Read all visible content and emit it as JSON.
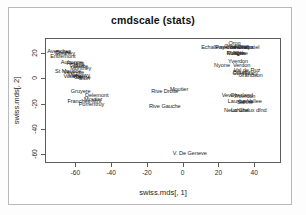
{
  "figure": {
    "title": "cmdscale (stats)",
    "xlabel": "swiss.mds[, 1]",
    "ylabel": "swiss.mds[, 2]",
    "frame_color": "#5c5c5c",
    "text_color": "#1c1c1c",
    "background": "#ffffff"
  },
  "chart_data": {
    "type": "scatter",
    "title": "cmdscale (stats)",
    "xlabel": "swiss.mds[, 1]",
    "ylabel": "swiss.mds[, 2]",
    "xlim": [
      -77,
      55
    ],
    "ylim": [
      -67,
      32
    ],
    "grid": false,
    "legend": null,
    "xticks": [
      -60,
      -40,
      -20,
      0,
      20,
      40
    ],
    "yticks": [
      20,
      0,
      -20,
      -40,
      -60
    ],
    "note": "Each observation is drawn as its text label at its (x,y) coordinate; no plotting symbols are used.",
    "points": [
      {
        "label": "Avenches",
        "x": -69,
        "y": 22
      },
      {
        "label": "Broye",
        "x": -67,
        "y": 21
      },
      {
        "label": "Entremont",
        "x": -67,
        "y": 18
      },
      {
        "label": "Conthey",
        "x": -66,
        "y": 20
      },
      {
        "label": "Aubonne",
        "x": -62,
        "y": 13
      },
      {
        "label": "Herens",
        "x": -60,
        "y": 12
      },
      {
        "label": "Sierre",
        "x": -57,
        "y": 10
      },
      {
        "label": "Glane",
        "x": -59,
        "y": 11
      },
      {
        "label": "St Maurice",
        "x": -64,
        "y": 6
      },
      {
        "label": "Veveyse",
        "x": -61,
        "y": 5
      },
      {
        "label": "Monthey",
        "x": -57,
        "y": 8
      },
      {
        "label": "Martigwy",
        "x": -58,
        "y": 3
      },
      {
        "label": "Vouvry",
        "x": -62,
        "y": 2
      },
      {
        "label": "Visp",
        "x": -59,
        "y": 2
      },
      {
        "label": "Sion",
        "x": -55,
        "y": 0
      },
      {
        "label": "Sarine",
        "x": -56,
        "y": 1
      },
      {
        "label": "Gruyere",
        "x": -57,
        "y": -10
      },
      {
        "label": "Delemont",
        "x": -48,
        "y": -13
      },
      {
        "label": "Franches-Mnt",
        "x": -55,
        "y": -18
      },
      {
        "label": "Moutier",
        "x": -50,
        "y": -16
      },
      {
        "label": "Porrentruy",
        "x": -51,
        "y": -20
      },
      {
        "label": "Rive Droite",
        "x": -10,
        "y": -10
      },
      {
        "label": "Moutier",
        "x": -2,
        "y": -8
      },
      {
        "label": "Rive Gauche",
        "x": -10,
        "y": -22
      },
      {
        "label": "V. De Geneve",
        "x": 4,
        "y": -59
      },
      {
        "label": "Echallens",
        "x": 17,
        "y": 25
      },
      {
        "label": "Payerne",
        "x": 24,
        "y": 25
      },
      {
        "label": "Oron",
        "x": 29,
        "y": 28
      },
      {
        "label": "Grandson",
        "x": 30,
        "y": 26
      },
      {
        "label": "Cossonay",
        "x": 31,
        "y": 25
      },
      {
        "label": "La Chaux",
        "x": 33,
        "y": 25
      },
      {
        "label": "Neuchatel",
        "x": 36,
        "y": 25
      },
      {
        "label": "Rolle",
        "x": 28,
        "y": 20
      },
      {
        "label": "Morges",
        "x": 30,
        "y": 20
      },
      {
        "label": "Aigle",
        "x": 31,
        "y": 20
      },
      {
        "label": "Orbe",
        "x": 33,
        "y": 20
      },
      {
        "label": "Yverdon",
        "x": 31,
        "y": 14
      },
      {
        "label": "Nyone",
        "x": 22,
        "y": 11
      },
      {
        "label": "Verdon",
        "x": 33,
        "y": 11
      },
      {
        "label": "Val de Ruz",
        "x": 36,
        "y": 7
      },
      {
        "label": "Boudry",
        "x": 33,
        "y": 5
      },
      {
        "label": "Courtelary",
        "x": 35,
        "y": 4
      },
      {
        "label": "Grandson",
        "x": 38,
        "y": 3
      },
      {
        "label": "Vevey",
        "x": 26,
        "y": -13
      },
      {
        "label": "Oberland",
        "x": 33,
        "y": -13
      },
      {
        "label": "Yverdon",
        "x": 35,
        "y": -14
      },
      {
        "label": "Lausanne",
        "x": 32,
        "y": -18
      },
      {
        "label": "La Vallee",
        "x": 38,
        "y": -18
      },
      {
        "label": "Sarine",
        "x": 35,
        "y": -19
      },
      {
        "label": "Neuchatel",
        "x": 30,
        "y": -25
      },
      {
        "label": "La Chaux dfnd",
        "x": 37,
        "y": -25
      }
    ]
  }
}
